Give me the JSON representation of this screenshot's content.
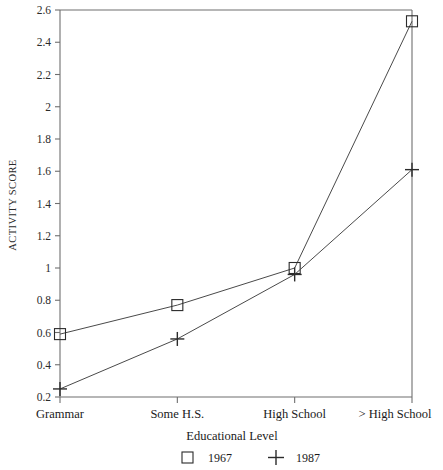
{
  "chart_data": {
    "type": "line",
    "title": "",
    "xlabel": "Educational Level",
    "ylabel": "ACTIVITY SCORE",
    "categories": [
      "Grammar",
      "Some H.S.",
      "High School",
      "> High School"
    ],
    "ylim": [
      0.2,
      2.6
    ],
    "yticks": [
      "0.2",
      "0.4",
      "0.6",
      "0.8",
      "1",
      "1.2",
      "1.4",
      "1.6",
      "1.8",
      "2",
      "2.2",
      "2.4",
      "2.6"
    ],
    "ytick_values": [
      0.2,
      0.4,
      0.6,
      0.8,
      1,
      1.2,
      1.4,
      1.6,
      1.8,
      2,
      2.2,
      2.4,
      2.6
    ],
    "grid": false,
    "legend_position": "bottom",
    "series": [
      {
        "name": "1967",
        "marker": "square",
        "values": [
          0.59,
          0.77,
          1.0,
          2.53
        ]
      },
      {
        "name": "1987",
        "marker": "plus",
        "values": [
          0.25,
          0.56,
          0.96,
          1.61
        ]
      }
    ]
  },
  "axes": {
    "y_axis_label": "ACTIVITY SCORE",
    "x_axis_title": "Educational Level"
  },
  "legend": {
    "entries": [
      {
        "marker_name": "square-marker-icon",
        "label": "1967"
      },
      {
        "marker_name": "plus-marker-icon",
        "label": "1987"
      }
    ]
  }
}
